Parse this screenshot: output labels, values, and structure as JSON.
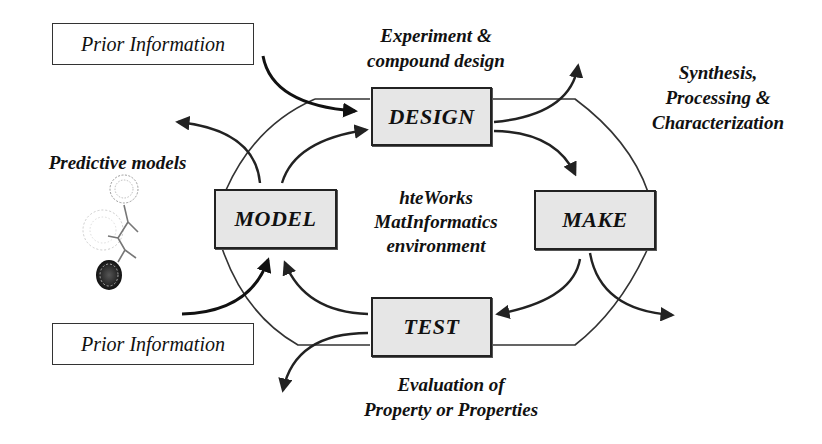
{
  "center_label": {
    "lines": [
      "hteWorks",
      "MatInformatics",
      "environment"
    ]
  },
  "stages": {
    "design": "DESIGN",
    "make": "MAKE",
    "test": "TEST",
    "model": "MODEL"
  },
  "annotations": {
    "design": [
      "Experiment &",
      "compound design"
    ],
    "make": [
      "Synthesis,",
      "Processing &",
      "Characterization"
    ],
    "test": [
      "Evaluation of",
      "Property or Properties"
    ],
    "model": [
      "Predictive models"
    ]
  },
  "prior_information": {
    "top": "Prior Information",
    "bottom": "Prior Information"
  },
  "icons": {
    "molecule": "molecular-structure-illustration"
  },
  "colors": {
    "box_fill": "#e6e6e6",
    "stroke": "#222222",
    "background": "#ffffff"
  }
}
